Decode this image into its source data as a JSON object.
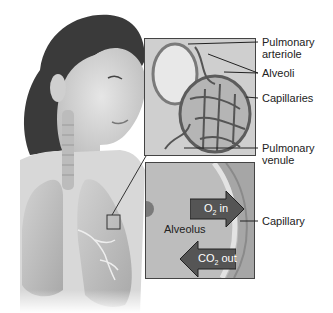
{
  "diagram": {
    "title": "",
    "upper_inset_labels": [
      {
        "id": "pulmonary-arteriole",
        "text": "Pulmonary arteriole"
      },
      {
        "id": "alveoli",
        "text": "Alveoli"
      },
      {
        "id": "capillaries",
        "text": "Capillaries"
      },
      {
        "id": "pulmonary-venule",
        "text": "Pulmonary venule"
      }
    ],
    "lower_inset": {
      "alveolus_label": "Alveolus",
      "capillary_label": "Capillary",
      "o2_arrow": {
        "prefix": "O",
        "sub": "2",
        "suffix": " in"
      },
      "co2_arrow": {
        "prefix": "CO",
        "sub": "2",
        "suffix": " out"
      }
    },
    "colors": {
      "arrow_fill": "#555555",
      "box_border": "#444444",
      "label_text": "#222222"
    }
  }
}
